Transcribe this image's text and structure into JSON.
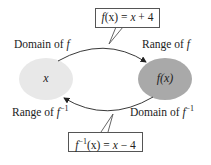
{
  "diagram": {
    "top_box": {
      "fn": "f",
      "arg": "(x)",
      "eq": " = ",
      "rhs_var": "x",
      "rhs_rest": " + 4"
    },
    "bottom_box": {
      "fn": "f",
      "sup": "−1",
      "arg": "(x)",
      "eq": " = ",
      "rhs_var": "x",
      "rhs_rest": " − 4"
    },
    "labels": {
      "domain_f": {
        "text": "Domain of ",
        "sym": "f"
      },
      "range_f": {
        "text": "Range of ",
        "sym": "f"
      },
      "range_finv": {
        "text": "Range of ",
        "sym": "f",
        "sup": "−1"
      },
      "domain_finv": {
        "text": "Domain of ",
        "sym": "f",
        "sup": "−1"
      }
    },
    "left_ellipse": {
      "label": "x",
      "color": "#e8e8e8"
    },
    "right_ellipse": {
      "label": "f(x)",
      "color": "#a9a9a9"
    }
  }
}
